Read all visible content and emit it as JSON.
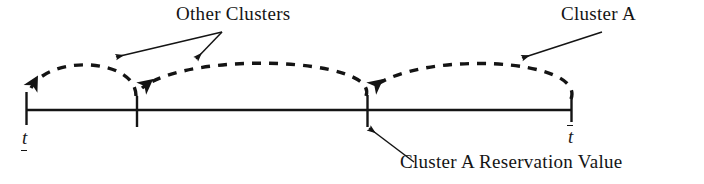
{
  "figure": {
    "background_color": "#ffffff",
    "ink_color": "#141414",
    "labels": {
      "other_clusters": "Other Clusters",
      "cluster_a": "Cluster A",
      "reservation_value": "Cluster A Reservation Value",
      "axis_lower": "t",
      "axis_upper": "t"
    },
    "axis": {
      "name": "time-axis",
      "y": 110,
      "x_start": 26,
      "x_end": 572,
      "line_width": 2.2,
      "ticks": [
        {
          "name": "tick-lower-bound",
          "x": 26,
          "label": "t",
          "label_style": "underbar"
        },
        {
          "name": "tick-other-cluster-boundary",
          "x": 137,
          "label": "",
          "label_style": "none"
        },
        {
          "name": "tick-cluster-a-reservation-value",
          "x": 367,
          "label": "",
          "label_style": "none"
        },
        {
          "name": "tick-upper-bound",
          "x": 572,
          "label": "t",
          "label_style": "overbar"
        }
      ]
    },
    "arcs": [
      {
        "name": "arc-other-cluster-1",
        "from_x": 137,
        "to_x": 26,
        "peak_y": 60,
        "dashed": true,
        "arrow_at": "to"
      },
      {
        "name": "arc-other-cluster-2",
        "from_x": 367,
        "to_x": 137,
        "peak_y": 55,
        "dashed": true,
        "arrow_at": "to"
      },
      {
        "name": "arc-cluster-a",
        "from_x": 572,
        "to_x": 367,
        "peak_y": 55,
        "dashed": true,
        "arrow_at": "to"
      }
    ],
    "annotations": [
      {
        "name": "annotation-other-clusters-left",
        "from_x": 222,
        "from_y": 33,
        "to_x": 117,
        "to_y": 57
      },
      {
        "name": "annotation-other-clusters-right",
        "from_x": 222,
        "from_y": 33,
        "to_x": 196,
        "to_y": 59
      },
      {
        "name": "annotation-cluster-a",
        "from_x": 600,
        "from_y": 33,
        "to_x": 523,
        "to_y": 58
      },
      {
        "name": "annotation-reservation-value",
        "from_x": 412,
        "from_y": 161,
        "to_x": 370,
        "to_y": 129
      }
    ]
  }
}
